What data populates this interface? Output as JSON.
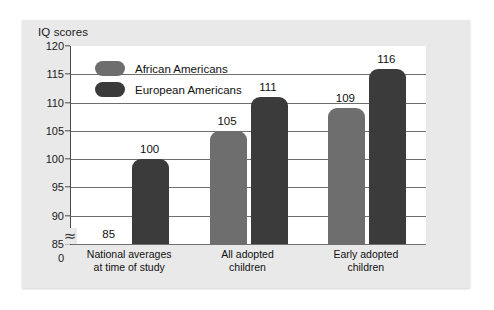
{
  "chart_data": {
    "type": "bar",
    "title": "IQ scores",
    "xlabel": "",
    "ylabel": "IQ scores",
    "ylim": [
      85,
      120
    ],
    "axis_break": true,
    "axis_break_symbol": "≈",
    "zero_tick_label": "0",
    "grid": true,
    "legend_position": "top-left",
    "yticks": [
      120,
      115,
      110,
      105,
      100,
      95,
      90,
      85
    ],
    "ytick_labels": [
      "120",
      "115",
      "110",
      "105",
      "100",
      "95",
      "90",
      "85"
    ],
    "categories": [
      "National averages\nat time of study",
      "All adopted\nchildren",
      "Early adopted\nchildren"
    ],
    "series": [
      {
        "name": "African Americans",
        "color": "#6e6e6e",
        "values": [
          85,
          105,
          109
        ]
      },
      {
        "name": "European Americans",
        "color": "#3b3b3b",
        "values": [
          100,
          111,
          116
        ]
      }
    ],
    "bar_labels": [
      [
        "85",
        "100"
      ],
      [
        "105",
        "111"
      ],
      [
        "109",
        "116"
      ]
    ]
  },
  "legend": {
    "items": [
      {
        "label": "African Americans",
        "swatch": "light"
      },
      {
        "label": "European Americans",
        "swatch": "dark"
      }
    ]
  },
  "colors": {
    "panel_background": "#e9e9e9",
    "plot_background": "#ffffff",
    "axis": "#4a4a4a",
    "gridline": "#6f6f6f",
    "series_light": "#6e6e6e",
    "series_dark": "#3b3b3b",
    "text": "#111111"
  }
}
